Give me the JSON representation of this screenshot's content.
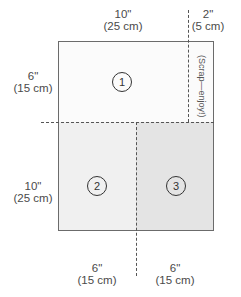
{
  "diagram": {
    "type": "cutting-layout",
    "colors": {
      "panel1": "#fbfbfb",
      "panel2": "#f0f0f0",
      "panel3": "#e6e6e6",
      "scrap": "#fbfbfb",
      "outline": "#6b6b6b",
      "dash": "#555555"
    },
    "dimensions": {
      "top_main": {
        "imperial": "10\"",
        "metric": "(25 cm)"
      },
      "top_scrap": {
        "imperial": "2\"",
        "metric": "(5 cm)"
      },
      "left_top": {
        "imperial": "6\"",
        "metric": "(15 cm)"
      },
      "left_bottom": {
        "imperial": "10\"",
        "metric": "(25 cm)"
      },
      "bottom_left": {
        "imperial": "6\"",
        "metric": "(15 cm)"
      },
      "bottom_right": {
        "imperial": "6\"",
        "metric": "(15 cm)"
      }
    },
    "pieces": [
      {
        "id": "1",
        "label": "1"
      },
      {
        "id": "2",
        "label": "2"
      },
      {
        "id": "3",
        "label": "3"
      }
    ],
    "scrap_label": "(Scrap—enjoy!)"
  }
}
